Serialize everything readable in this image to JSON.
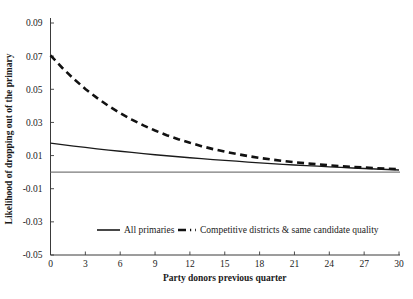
{
  "chart_data": {
    "type": "line",
    "title": "",
    "xlabel": "Party donors previous quarter",
    "ylabel": "Likelihood of dropping out of the primary",
    "xlim": [
      0,
      30
    ],
    "ylim": [
      -0.05,
      0.09
    ],
    "xticks": [
      "0",
      "3",
      "6",
      "9",
      "12",
      "15",
      "18",
      "21",
      "24",
      "27",
      "30"
    ],
    "xtick_values": [
      0,
      3,
      6,
      9,
      12,
      15,
      18,
      21,
      24,
      27,
      30
    ],
    "yticks": [
      "0.09",
      "0.07",
      "0.05",
      "0.03",
      "0.01",
      "-0.01",
      "-0.03",
      "-0.05"
    ],
    "ytick_values": [
      0.09,
      0.07,
      0.05,
      0.03,
      0.01,
      -0.01,
      -0.03,
      -0.05
    ],
    "grid": false,
    "legend_position": "inside-bottom",
    "reference_line": {
      "y": 0,
      "color": "#7a7a7a"
    },
    "x": [
      0,
      1,
      2,
      3,
      4,
      5,
      6,
      7,
      8,
      9,
      10,
      11,
      12,
      13,
      14,
      15,
      16,
      17,
      18,
      19,
      20,
      21,
      22,
      23,
      24,
      25,
      26,
      27,
      28,
      29,
      30
    ],
    "series": [
      {
        "name": "All primaries",
        "style": "solid",
        "color": "#1a1a1a",
        "values": [
          0.0175,
          0.0166,
          0.0157,
          0.0149,
          0.0141,
          0.0133,
          0.0126,
          0.0119,
          0.0112,
          0.0105,
          0.0099,
          0.0093,
          0.0087,
          0.0081,
          0.0076,
          0.0071,
          0.0066,
          0.0061,
          0.0056,
          0.0052,
          0.0047,
          0.0043,
          0.0039,
          0.0036,
          0.0032,
          0.0029,
          0.0025,
          0.0022,
          0.0019,
          0.0016,
          0.0013
        ]
      },
      {
        "name": "Competitive districts & same candidate quality",
        "style": "dashed",
        "color": "#111111",
        "values": [
          0.0705,
          0.063,
          0.0563,
          0.0502,
          0.0448,
          0.0399,
          0.0356,
          0.0317,
          0.0282,
          0.0251,
          0.0223,
          0.0199,
          0.0177,
          0.0157,
          0.0139,
          0.0124,
          0.011,
          0.0097,
          0.0086,
          0.0076,
          0.0068,
          0.006,
          0.0053,
          0.0047,
          0.0041,
          0.0036,
          0.0032,
          0.0028,
          0.0024,
          0.0021,
          0.0018
        ]
      }
    ],
    "legend": [
      {
        "label": "All primaries",
        "style": "solid"
      },
      {
        "label": "Competitive districts & same candidate quality",
        "style": "dashed"
      }
    ]
  }
}
